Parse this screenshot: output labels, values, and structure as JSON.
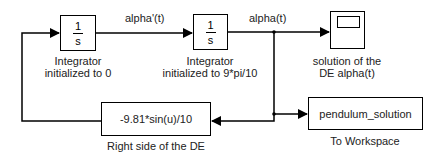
{
  "diagram": {
    "blocks": {
      "integrator1": {
        "numerator": "1",
        "denominator": "s",
        "label_line1": "Integrator",
        "label_line2": "initialized to 0"
      },
      "integrator2": {
        "numerator": "1",
        "denominator": "s",
        "label_line1": "Integrator",
        "label_line2": "initialized to 9*pi/10"
      },
      "scope": {
        "label_line1": "solution of the",
        "label_line2": "DE alpha(t)"
      },
      "fcn": {
        "expression": "-9.81*sin(u)/10",
        "label": "Right side of the DE"
      },
      "to_workspace": {
        "variable": "pendulum_solution",
        "label": "To Workspace"
      }
    },
    "signals": {
      "alpha_dot": "alpha'(t)",
      "alpha": "alpha(t)"
    },
    "colors": {
      "line": "#000000",
      "background": "#ffffff"
    }
  }
}
